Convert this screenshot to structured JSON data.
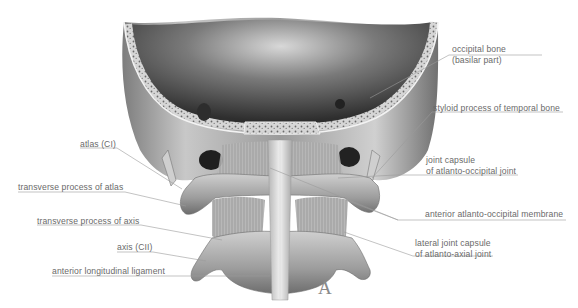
{
  "figure": {
    "panel_letter": "A",
    "labels": {
      "left": [
        {
          "id": "atlas",
          "text": "atlas (CI)"
        },
        {
          "id": "transverse-process-atlas",
          "text": "transverse process of atlas"
        },
        {
          "id": "transverse-process-axis",
          "text": "transverse process of axis"
        },
        {
          "id": "axis",
          "text": "axis (CII)"
        },
        {
          "id": "anterior-longitudinal-ligament",
          "text": "anterior longitudinal ligament"
        }
      ],
      "right": [
        {
          "id": "occipital-bone",
          "line1": "occipital bone",
          "line2": "(basilar part)"
        },
        {
          "id": "styloid-process",
          "text": "styloid process of temporal bone"
        },
        {
          "id": "joint-capsule-ao",
          "line1": "joint capsule",
          "line2": "of atlanto-occipital joint"
        },
        {
          "id": "anterior-ao-membrane",
          "text": "anterior atlanto-occipital membrane"
        },
        {
          "id": "lateral-joint-capsule-aa",
          "line1": "lateral joint capsule",
          "line2": "of atlanto-axial joint"
        }
      ]
    },
    "colors": {
      "label_text": "#6a6a6a",
      "leader_line": "#9a9a9a",
      "bone_light": "#e6e6e6",
      "bone_mid": "#a9a9a9",
      "bone_dark": "#3c3c3c"
    }
  }
}
